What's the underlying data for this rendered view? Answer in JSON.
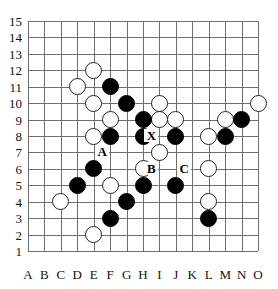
{
  "board": {
    "type": "go-board-diagram",
    "size": 15,
    "columns": [
      "A",
      "B",
      "C",
      "D",
      "E",
      "F",
      "G",
      "H",
      "I",
      "J",
      "K",
      "L",
      "M",
      "N",
      "O"
    ],
    "rows": [
      "15",
      "14",
      "13",
      "12",
      "11",
      "10",
      "9",
      "8",
      "7",
      "6",
      "5",
      "4",
      "3",
      "2",
      "1"
    ],
    "geometry": {
      "origin_x": 28,
      "origin_y": 21,
      "spacing": 16.43,
      "stone_diameter": 17
    },
    "colors": {
      "grid": "#6e6e6e",
      "black_stone": "#000000",
      "white_stone_fill": "#ffffff",
      "white_stone_edge": "#222222",
      "label": "#111111"
    },
    "black_stones": [
      "F11",
      "G10",
      "H9",
      "F8",
      "H8",
      "J8",
      "M8",
      "N9",
      "E6",
      "D5",
      "H5",
      "J5",
      "G4",
      "F3",
      "L3"
    ],
    "white_stones": [
      "E12",
      "D11",
      "E10",
      "F9",
      "I10",
      "I9",
      "J9",
      "M9",
      "O10",
      "E8",
      "L8",
      "I7",
      "H6",
      "L6",
      "F5",
      "C4",
      "L4",
      "E2"
    ],
    "markers": [
      {
        "label": "X",
        "point": "I8"
      },
      {
        "label": "A",
        "point": "F7"
      },
      {
        "label": "B",
        "point": "I6"
      },
      {
        "label": "C",
        "point": "K6"
      }
    ]
  }
}
